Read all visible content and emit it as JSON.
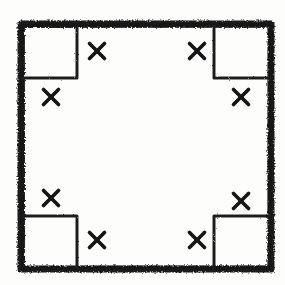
{
  "figure": {
    "medium": "marker sketch on paper",
    "canvas": {
      "width": 285,
      "height": 285
    },
    "colors": {
      "ink": "#1a1a1a",
      "paper": "#fdfdfc",
      "notch_ink": "#1f1f1f"
    },
    "outer_frame": {
      "name": "outer-square",
      "left": 21,
      "top": 24,
      "right": 271,
      "bottom": 269,
      "stroke_width": 7,
      "style": "thick rough marker stroke"
    },
    "corner_notches": [
      {
        "id": "notch-top-left",
        "corner": "top-left",
        "left": 22,
        "top": 25,
        "right": 77,
        "bottom": 78,
        "stroke_width": 3
      },
      {
        "id": "notch-top-right",
        "corner": "top-right",
        "left": 214,
        "top": 25,
        "right": 270,
        "bottom": 78,
        "stroke_width": 3
      },
      {
        "id": "notch-bottom-left",
        "corner": "bottom-left",
        "left": 22,
        "top": 216,
        "right": 77,
        "bottom": 268,
        "stroke_width": 3
      },
      {
        "id": "notch-bottom-right",
        "corner": "bottom-right",
        "left": 214,
        "top": 216,
        "right": 270,
        "bottom": 268,
        "stroke_width": 3
      }
    ],
    "x_marks": [
      {
        "id": "x-top-left-outer",
        "near_corner": "top-left",
        "cx": 97,
        "cy": 51,
        "size": 15
      },
      {
        "id": "x-top-left-inner",
        "near_corner": "top-left",
        "cx": 51,
        "cy": 97,
        "size": 15
      },
      {
        "id": "x-top-right-outer",
        "near_corner": "top-right",
        "cx": 197,
        "cy": 51,
        "size": 15
      },
      {
        "id": "x-top-right-inner",
        "near_corner": "top-right",
        "cx": 241,
        "cy": 97,
        "size": 15
      },
      {
        "id": "x-bottom-left-inner",
        "near_corner": "bottom-left",
        "cx": 51,
        "cy": 198,
        "size": 15
      },
      {
        "id": "x-bottom-left-outer",
        "near_corner": "bottom-left",
        "cx": 97,
        "cy": 240,
        "size": 15
      },
      {
        "id": "x-bottom-right-inner",
        "near_corner": "bottom-right",
        "cx": 241,
        "cy": 201,
        "size": 15
      },
      {
        "id": "x-bottom-right-outer",
        "near_corner": "bottom-right",
        "cx": 197,
        "cy": 240,
        "size": 15
      }
    ],
    "counts": {
      "x_mark_total": "8",
      "corner_notch_total": "4"
    }
  }
}
